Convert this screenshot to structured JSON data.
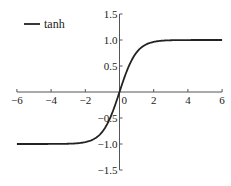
{
  "chart_data": {
    "type": "line",
    "title": "",
    "xlabel": "",
    "ylabel": "",
    "xlim": [
      -6,
      6
    ],
    "ylim": [
      -1.5,
      1.5
    ],
    "grid": false,
    "legend_position": "upper left",
    "x_ticks": [
      -6,
      -4,
      -2,
      0,
      2,
      4,
      6
    ],
    "x_tick_labels": [
      "−6",
      "−4",
      "−2",
      "0",
      "2",
      "4",
      "6"
    ],
    "y_ticks": [
      -1.5,
      -1.0,
      -0.5,
      0.5,
      1.0,
      1.5
    ],
    "y_tick_labels": [
      "−1.5",
      "−1.0",
      "−0.5",
      "0.5",
      "1.0",
      "1.5"
    ],
    "series": [
      {
        "name": "tanh",
        "color": "#222222",
        "x": [
          -6,
          -5,
          -4,
          -3,
          -2.5,
          -2,
          -1.5,
          -1,
          -0.5,
          0,
          0.5,
          1,
          1.5,
          2,
          2.5,
          3,
          4,
          5,
          6
        ],
        "values": [
          -1.0,
          -1.0,
          -0.999,
          -0.995,
          -0.987,
          -0.964,
          -0.905,
          -0.762,
          -0.462,
          0.0,
          0.462,
          0.762,
          0.905,
          0.964,
          0.987,
          0.995,
          0.999,
          1.0,
          1.0
        ]
      }
    ]
  },
  "legend": {
    "label": "tanh"
  }
}
